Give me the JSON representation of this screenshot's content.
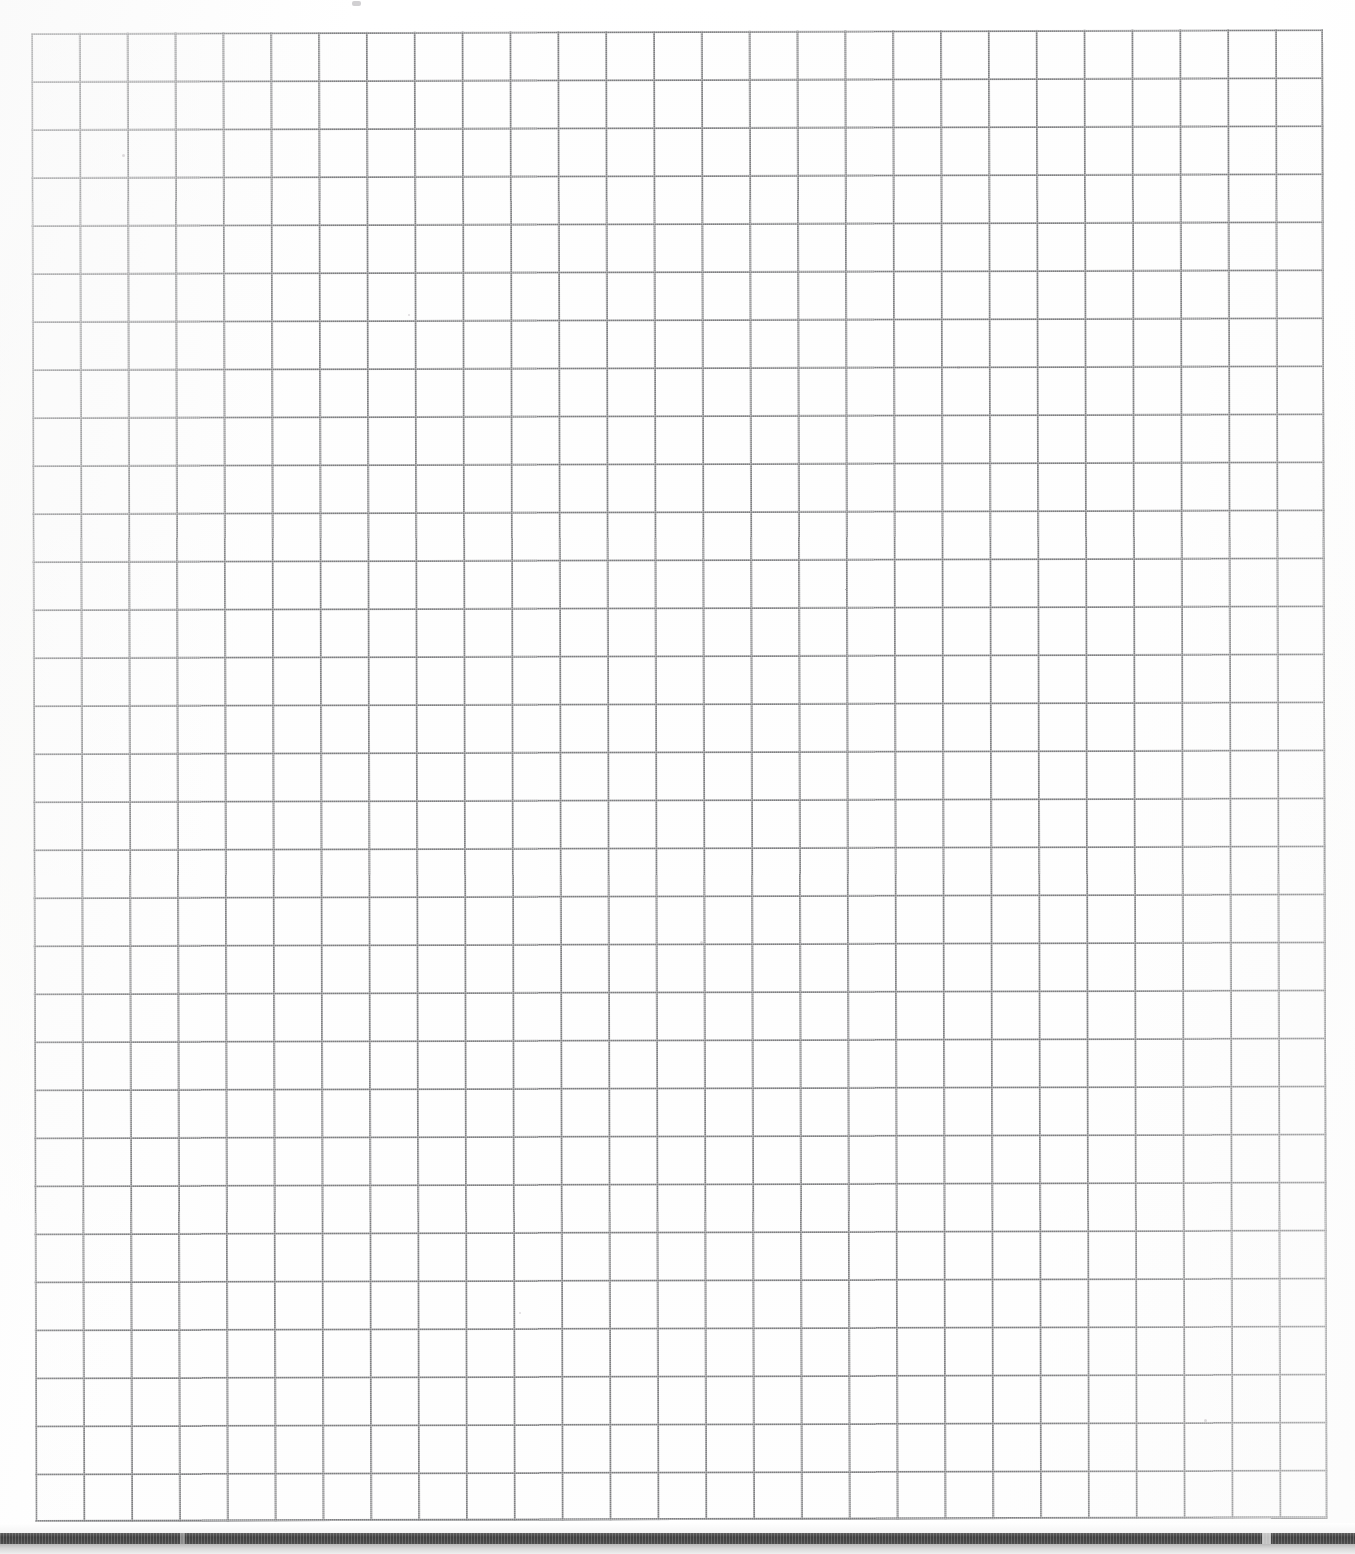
{
  "document": {
    "kind": "scanned-graph-paper",
    "title": "Blank quadrille grid page",
    "page_width_px": 1355,
    "page_height_px": 1554,
    "background_color": "#fdfdfd",
    "has_visible_text": false,
    "text_content": ""
  },
  "grid": {
    "name": "quadrille-grid",
    "columns": 27,
    "rows": 31,
    "cell_width_px": 47.85,
    "cell_height_px": 48.03,
    "line_color": "#7d7e80",
    "line_width_px": 1.7,
    "left_px": 31,
    "top_px": 33,
    "width_px": 1292,
    "height_px": 1489,
    "skew_degrees": -0.17,
    "style": "uniform single-weight ruling, no bold major lines",
    "cells_filled": 0,
    "annotations": []
  },
  "artifacts": {
    "name": "scan-artifacts",
    "page_edge_bar": {
      "label": "dark page-edge shadow bar",
      "color": "#3f3f3f",
      "top_px": 1533,
      "height_px": 11
    },
    "soft_band": {
      "label": "soft gray falloff band",
      "color": "#d8d8d8",
      "top_px": 1544,
      "height_px": 10
    },
    "specks": [
      {
        "label": "top-edge smudge",
        "x": 352,
        "y": 1,
        "w": 9,
        "h": 5
      },
      {
        "label": "speck",
        "x": 122,
        "y": 154,
        "w": 3,
        "h": 3
      },
      {
        "label": "speck",
        "x": 408,
        "y": 314,
        "w": 2,
        "h": 2
      },
      {
        "label": "speck",
        "x": 957,
        "y": 366,
        "w": 3,
        "h": 3
      },
      {
        "label": "speck",
        "x": 700,
        "y": 941,
        "w": 3,
        "h": 3
      },
      {
        "label": "speck",
        "x": 1204,
        "y": 1419,
        "w": 3,
        "h": 3
      },
      {
        "label": "speck",
        "x": 519,
        "y": 1312,
        "w": 2,
        "h": 2
      }
    ]
  }
}
